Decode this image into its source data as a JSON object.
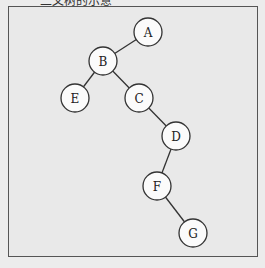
{
  "caption": "二叉树的示意",
  "tree": {
    "nodes": [
      {
        "id": "A",
        "label": "A",
        "x": 148,
        "y": 32
      },
      {
        "id": "B",
        "label": "B",
        "x": 103,
        "y": 61
      },
      {
        "id": "E",
        "label": "E",
        "x": 75,
        "y": 98
      },
      {
        "id": "C",
        "label": "C",
        "x": 139,
        "y": 98
      },
      {
        "id": "D",
        "label": "D",
        "x": 176,
        "y": 136
      },
      {
        "id": "F",
        "label": "F",
        "x": 157,
        "y": 186
      },
      {
        "id": "G",
        "label": "G",
        "x": 193,
        "y": 233
      }
    ],
    "edges": [
      [
        "A",
        "B"
      ],
      [
        "B",
        "E"
      ],
      [
        "B",
        "C"
      ],
      [
        "C",
        "D"
      ],
      [
        "D",
        "F"
      ],
      [
        "F",
        "G"
      ]
    ],
    "radius": 14
  }
}
